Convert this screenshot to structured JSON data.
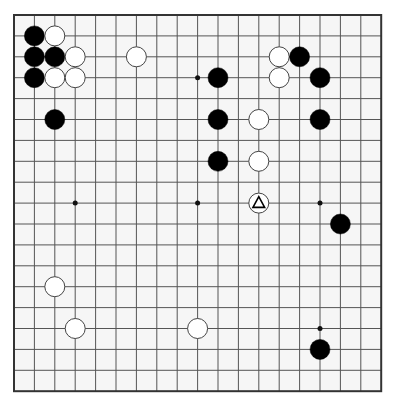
{
  "board": {
    "size": 19,
    "visible_cols": 19,
    "visible_rows": 19,
    "origin_x": 14,
    "origin_y": 15,
    "spacing_x": 20.4,
    "spacing_y": 20.9,
    "stone_radius": 10,
    "line_color": "#555555",
    "border_color": "#333333",
    "background": "#f6f6f6",
    "black_color": "#000000",
    "white_color": "#ffffff",
    "star_points": [
      [
        3,
        3
      ],
      [
        9,
        3
      ],
      [
        15,
        3
      ],
      [
        3,
        9
      ],
      [
        9,
        9
      ],
      [
        15,
        9
      ],
      [
        3,
        15
      ],
      [
        9,
        15
      ],
      [
        15,
        15
      ]
    ],
    "visible_star_points": [
      [
        9,
        3
      ],
      [
        3,
        9
      ],
      [
        9,
        9
      ],
      [
        15,
        9
      ],
      [
        15,
        15
      ]
    ]
  },
  "stones": [
    {
      "color": "black",
      "col": 1,
      "row": 1
    },
    {
      "color": "white",
      "col": 2,
      "row": 1
    },
    {
      "color": "black",
      "col": 1,
      "row": 2
    },
    {
      "color": "black",
      "col": 2,
      "row": 2
    },
    {
      "color": "white",
      "col": 3,
      "row": 2
    },
    {
      "color": "black",
      "col": 1,
      "row": 3
    },
    {
      "color": "white",
      "col": 2,
      "row": 3
    },
    {
      "color": "white",
      "col": 3,
      "row": 3
    },
    {
      "color": "white",
      "col": 6,
      "row": 2
    },
    {
      "color": "black",
      "col": 2,
      "row": 5
    },
    {
      "color": "white",
      "col": 13,
      "row": 2
    },
    {
      "color": "black",
      "col": 14,
      "row": 2
    },
    {
      "color": "black",
      "col": 10,
      "row": 3
    },
    {
      "color": "white",
      "col": 13,
      "row": 3
    },
    {
      "color": "black",
      "col": 15,
      "row": 3
    },
    {
      "color": "black",
      "col": 10,
      "row": 5
    },
    {
      "color": "white",
      "col": 12,
      "row": 5
    },
    {
      "color": "black",
      "col": 15,
      "row": 5
    },
    {
      "color": "black",
      "col": 10,
      "row": 7
    },
    {
      "color": "white",
      "col": 12,
      "row": 7
    },
    {
      "color": "white",
      "col": 12,
      "row": 9,
      "marker": "triangle"
    },
    {
      "color": "black",
      "col": 16,
      "row": 10
    },
    {
      "color": "white",
      "col": 2,
      "row": 13
    },
    {
      "color": "white",
      "col": 3,
      "row": 15
    },
    {
      "color": "white",
      "col": 9,
      "row": 15
    },
    {
      "color": "black",
      "col": 15,
      "row": 16
    }
  ],
  "markers": [
    {
      "type": "triangle",
      "col": 12,
      "row": 9,
      "on": "white-stone"
    }
  ]
}
